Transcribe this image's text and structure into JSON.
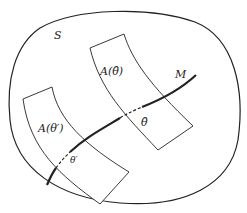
{
  "diagram": {
    "labels": {
      "set": "S",
      "manifold": "M",
      "region_hat": "A(θ̂)",
      "region_prime": "A(θ′)",
      "point_hat": "θ̂",
      "point_prime": "θ′"
    },
    "colors": {
      "stroke": "#222222",
      "background": "#ffffff"
    }
  }
}
